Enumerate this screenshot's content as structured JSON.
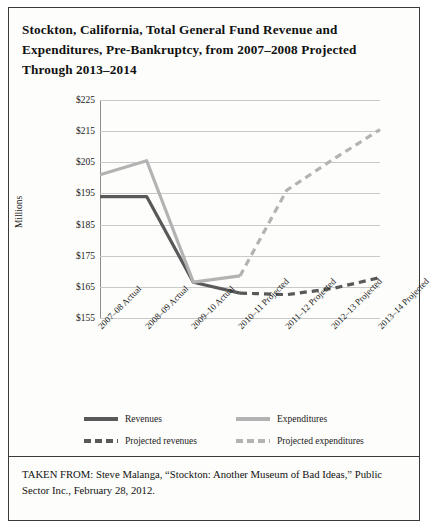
{
  "figure": {
    "title": "Stockton, California, Total General Fund Revenue and Expenditures, Pre-Bankruptcy, from 2007–2008 Projected Through 2013–2014",
    "source": "TAKEN FROM: Steve Malanga, “Stockton: Another Museum of Bad Ideas,” Public Sector Inc., February 28, 2012."
  },
  "colors": {
    "revenues": "#595959",
    "expenditures": "#b3b3b3",
    "grid": "#c9c9c9",
    "axis": "#8d8d8d",
    "frame": "#3a3a3a"
  },
  "chart_data": {
    "type": "line",
    "title": "Stockton, California, Total General Fund Revenue and Expenditures, Pre-Bankruptcy, from 2007–2008 Projected Through 2013–2014",
    "xlabel": "",
    "ylabel": "Millions",
    "ylim": [
      155,
      225
    ],
    "yticks": [
      155,
      165,
      175,
      185,
      195,
      205,
      215,
      225
    ],
    "ytick_labels": [
      "$155",
      "$165",
      "$175",
      "$185",
      "$195",
      "$205",
      "$215",
      "$225"
    ],
    "grid": true,
    "legend_position": "bottom",
    "categories": [
      "2007–08 Actual",
      "2008–09 Actual",
      "2009–10 Actual",
      "2010–11 Projected",
      "2011–12 Projected",
      "2012–13 Projected",
      "2013–14 Projected"
    ],
    "series": [
      {
        "name": "Revenues",
        "style": "solid",
        "color": "#595959",
        "values": [
          194,
          194,
          166.5,
          163,
          null,
          null,
          null
        ]
      },
      {
        "name": "Expenditures",
        "style": "solid",
        "color": "#b3b3b3",
        "values": [
          201,
          205.5,
          166.5,
          168.5,
          null,
          null,
          null
        ]
      },
      {
        "name": "Projected revenues",
        "style": "dashed",
        "color": "#595959",
        "values": [
          null,
          null,
          null,
          163,
          162.5,
          164.5,
          168
        ]
      },
      {
        "name": "Projected expenditures",
        "style": "dashed",
        "color": "#b3b3b3",
        "values": [
          null,
          null,
          null,
          168.5,
          196,
          206,
          215.5
        ]
      }
    ],
    "legend": [
      {
        "label": "Revenues",
        "swatch": "solid-dark"
      },
      {
        "label": "Expenditures",
        "swatch": "solid-light"
      },
      {
        "label": "Projected revenues",
        "swatch": "dashed-dark"
      },
      {
        "label": "Projected expenditures",
        "swatch": "dashed-light"
      }
    ]
  }
}
